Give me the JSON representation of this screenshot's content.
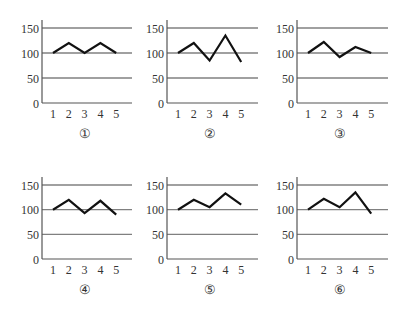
{
  "chart_data": [
    {
      "type": "line",
      "label": "①",
      "x": [
        1,
        2,
        3,
        4,
        5
      ],
      "values": [
        100,
        120,
        100,
        120,
        100
      ],
      "yticks": [
        0,
        50,
        100,
        150
      ],
      "xticks": [
        "1",
        "2",
        "3",
        "4",
        "5"
      ],
      "ylim": [
        0,
        150
      ],
      "grid": true,
      "title": "",
      "xlabel": "",
      "ylabel": ""
    },
    {
      "type": "line",
      "label": "②",
      "x": [
        1,
        2,
        3,
        4,
        5
      ],
      "values": [
        100,
        120,
        85,
        135,
        82
      ],
      "yticks": [
        0,
        50,
        100,
        150
      ],
      "xticks": [
        "1",
        "2",
        "3",
        "4",
        "5"
      ],
      "ylim": [
        0,
        150
      ],
      "grid": true,
      "title": "",
      "xlabel": "",
      "ylabel": ""
    },
    {
      "type": "line",
      "label": "③",
      "x": [
        1,
        2,
        3,
        4,
        5
      ],
      "values": [
        100,
        122,
        92,
        112,
        100
      ],
      "yticks": [
        0,
        50,
        100,
        150
      ],
      "xticks": [
        "1",
        "2",
        "3",
        "4",
        "5"
      ],
      "ylim": [
        0,
        150
      ],
      "grid": true,
      "title": "",
      "xlabel": "",
      "ylabel": ""
    },
    {
      "type": "line",
      "label": "④",
      "x": [
        1,
        2,
        3,
        4,
        5
      ],
      "values": [
        100,
        120,
        93,
        118,
        90
      ],
      "yticks": [
        0,
        50,
        100,
        150
      ],
      "xticks": [
        "1",
        "2",
        "3",
        "4",
        "5"
      ],
      "ylim": [
        0,
        150
      ],
      "grid": true,
      "title": "",
      "xlabel": "",
      "ylabel": ""
    },
    {
      "type": "line",
      "label": "⑤",
      "x": [
        1,
        2,
        3,
        4,
        5
      ],
      "values": [
        100,
        120,
        105,
        133,
        110
      ],
      "yticks": [
        0,
        50,
        100,
        150
      ],
      "xticks": [
        "1",
        "2",
        "3",
        "4",
        "5"
      ],
      "ylim": [
        0,
        150
      ],
      "grid": true,
      "title": "",
      "xlabel": "",
      "ylabel": ""
    },
    {
      "type": "line",
      "label": "⑥",
      "x": [
        1,
        2,
        3,
        4,
        5
      ],
      "values": [
        100,
        122,
        105,
        135,
        92
      ],
      "yticks": [
        0,
        50,
        100,
        150
      ],
      "xticks": [
        "1",
        "2",
        "3",
        "4",
        "5"
      ],
      "ylim": [
        0,
        150
      ],
      "grid": true,
      "title": "",
      "xlabel": "",
      "ylabel": ""
    }
  ],
  "style": {
    "line_color": "#111111",
    "grid_color": "#808080",
    "axis_color": "#555555",
    "text_color": "#333333"
  }
}
